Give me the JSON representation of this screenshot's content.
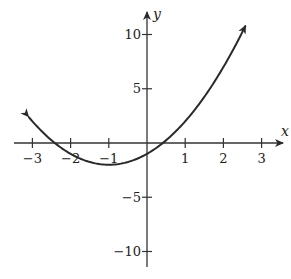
{
  "chart_data": {
    "type": "line",
    "title": "",
    "function": "y = x^2 + 2x - 1",
    "xlabel": "x",
    "ylabel": "y",
    "xlim": [
      -3.4,
      3.5
    ],
    "ylim": [
      -11.5,
      11.5
    ],
    "x_ticks": [
      -3,
      -2,
      -1,
      1,
      2,
      3
    ],
    "x_tick_labels": [
      "−3",
      "−2",
      "−1",
      "1",
      "2",
      "3"
    ],
    "y_ticks": [
      10,
      5,
      -5,
      -10
    ],
    "y_tick_labels": [
      "10",
      "5",
      "−5",
      "−10"
    ],
    "grid": false,
    "legend": null,
    "curve_domain": [
      -3.1,
      2.58
    ],
    "vertex": [
      -1,
      -2
    ],
    "y_intercept": [
      0,
      -1
    ],
    "x_intercepts": [
      -2.414,
      0.414
    ],
    "series": [
      {
        "name": "parabola",
        "x": [
          -3.1,
          -3,
          -2.5,
          -2,
          -1.5,
          -1,
          -0.5,
          0,
          0.5,
          1,
          1.5,
          2,
          2.5,
          2.58
        ],
        "y": [
          2.41,
          2,
          0.25,
          -1,
          -1.75,
          -2,
          -1.75,
          -1,
          0.25,
          2,
          4.25,
          7,
          10.25,
          10.82
        ],
        "arrows": "both ends",
        "color": "#2a2a2a"
      }
    ]
  },
  "style": {
    "axis_color": "#333333",
    "curve_color": "#2a2a2a"
  }
}
